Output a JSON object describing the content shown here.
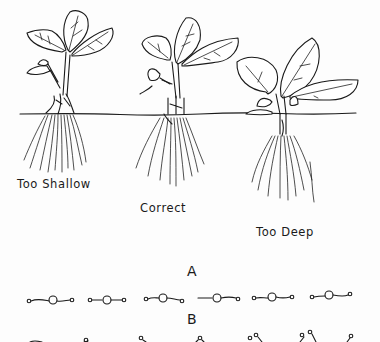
{
  "figure": {
    "plants": [
      {
        "id": "shallow",
        "label": "Too Shallow"
      },
      {
        "id": "correct",
        "label": "Correct"
      },
      {
        "id": "deep",
        "label": "Too Deep"
      }
    ],
    "rows": [
      {
        "id": "A",
        "label": "A"
      },
      {
        "id": "B",
        "label": "B"
      }
    ]
  }
}
